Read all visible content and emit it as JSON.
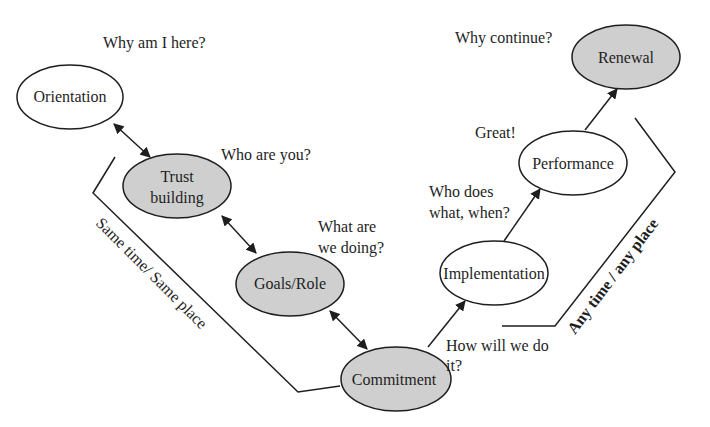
{
  "diagram": {
    "colors": {
      "shaded_fill": "#cfcfcf",
      "plain_fill": "#ffffff",
      "stroke": "#1e1e1e",
      "text": "#1e1e1e",
      "background": "#ffffff"
    },
    "nodes": [
      {
        "id": "orientation",
        "label": "Orientation",
        "shaded": false,
        "question": "Why am I here?"
      },
      {
        "id": "trust-building",
        "label_lines": [
          "Trust",
          "building"
        ],
        "shaded": true,
        "question": "Who are you?"
      },
      {
        "id": "goals-role",
        "label": "Goals/Role",
        "shaded": true,
        "question_lines": [
          "What are",
          "we doing?"
        ]
      },
      {
        "id": "commitment",
        "label": "Commitment",
        "shaded": true,
        "question_lines": [
          "How will we do",
          "it?"
        ]
      },
      {
        "id": "implementation",
        "label": "Implementation",
        "shaded": false,
        "question_lines": [
          "Who does",
          "what, when?"
        ]
      },
      {
        "id": "performance",
        "label": "Performance",
        "shaded": false,
        "question": "Great!"
      },
      {
        "id": "renewal",
        "label": "Renewal",
        "shaded": true,
        "question": "Why continue?"
      }
    ],
    "edges": [
      {
        "from": "orientation",
        "to": "trust-building",
        "type": "bidirectional"
      },
      {
        "from": "trust-building",
        "to": "goals-role",
        "type": "bidirectional"
      },
      {
        "from": "goals-role",
        "to": "commitment",
        "type": "bidirectional"
      },
      {
        "from": "commitment",
        "to": "implementation",
        "type": "directed"
      },
      {
        "from": "implementation",
        "to": "performance",
        "type": "directed"
      },
      {
        "from": "performance",
        "to": "renewal",
        "type": "directed"
      }
    ],
    "brackets": {
      "left": {
        "label": "Same time/ Same place"
      },
      "right": {
        "label": "Any time / any place"
      }
    }
  }
}
